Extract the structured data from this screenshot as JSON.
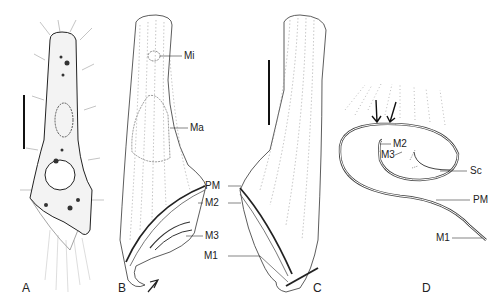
{
  "figure": {
    "panels": [
      {
        "id": "A",
        "letter": "A",
        "x": 22,
        "y": 282
      },
      {
        "id": "B",
        "letter": "B",
        "x": 118,
        "y": 282
      },
      {
        "id": "C",
        "letter": "C",
        "x": 313,
        "y": 282
      },
      {
        "id": "D",
        "letter": "D",
        "x": 422,
        "y": 282
      }
    ],
    "labels": {
      "B": [
        {
          "text": "Mi",
          "x": 184,
          "y": 51
        },
        {
          "text": "Ma",
          "x": 190,
          "y": 123
        },
        {
          "text": "PM",
          "x": 205,
          "y": 181
        },
        {
          "text": "M2",
          "x": 205,
          "y": 198
        },
        {
          "text": "M3",
          "x": 205,
          "y": 231
        }
      ],
      "C": [
        {
          "text": "M1",
          "x": 204,
          "y": 251
        }
      ],
      "D": [
        {
          "text": "M2",
          "x": 393,
          "y": 139
        },
        {
          "text": "M3",
          "x": 381,
          "y": 150
        },
        {
          "text": "Sc",
          "x": 470,
          "y": 166
        },
        {
          "text": "PM",
          "x": 473,
          "y": 195
        },
        {
          "text": "M1",
          "x": 436,
          "y": 233
        }
      ]
    },
    "scale_bars": [
      {
        "panel": "A",
        "x": 24,
        "y1": 95,
        "y2": 149
      },
      {
        "panel": "C",
        "x": 269,
        "y1": 60,
        "y2": 125
      }
    ],
    "colors": {
      "line": "#333333",
      "background": "#ffffff"
    }
  }
}
